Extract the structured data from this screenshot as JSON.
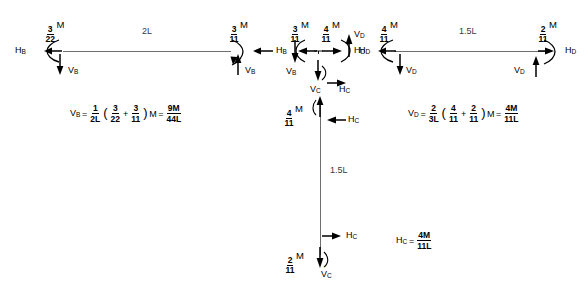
{
  "diagram": {
    "line_color": "#6e6e6e",
    "text_color": "#000000"
  },
  "members": {
    "left_beam": {
      "length_label": "2L"
    },
    "right_beam": {
      "length_label": "1.5L"
    },
    "column": {
      "length_label": "1.5L"
    }
  },
  "moments": {
    "left_end_B": {
      "num": "3",
      "den": "22",
      "unit": "M"
    },
    "left_beam_right_end": {
      "num": "3",
      "den": "11",
      "unit": "M"
    },
    "joint_left": {
      "num": "3",
      "den": "11",
      "unit": "M"
    },
    "joint_right": {
      "num": "4",
      "den": "11",
      "unit": "M"
    },
    "right_beam_left_end": {
      "num": "4",
      "den": "11",
      "unit": "M"
    },
    "right_end_D": {
      "num": "2",
      "den": "11",
      "unit": "M"
    },
    "column_top": {
      "num": "4",
      "den": "11",
      "unit": "M"
    },
    "column_bottom": {
      "num": "2",
      "den": "11",
      "unit": "M"
    }
  },
  "forces": {
    "HB": {
      "base": "H",
      "sub": "B"
    },
    "VB": {
      "base": "V",
      "sub": "B"
    },
    "HC": {
      "base": "H",
      "sub": "C"
    },
    "VC": {
      "base": "V",
      "sub": "C"
    },
    "HD": {
      "base": "H",
      "sub": "D"
    },
    "VD": {
      "base": "V",
      "sub": "D"
    }
  },
  "equations": {
    "VB": {
      "lhs_base": "V",
      "lhs_sub": "B",
      "eq1": "=",
      "coef": {
        "num": "1",
        "den": "2L"
      },
      "open": "(",
      "t1": {
        "num": "3",
        "den": "22"
      },
      "plus": "+",
      "t2": {
        "num": "3",
        "den": "11"
      },
      "close": ")",
      "unit": "M",
      "eq2": "=",
      "result": {
        "num": "9M",
        "den": "44L"
      }
    },
    "VD": {
      "lhs_base": "V",
      "lhs_sub": "D",
      "eq1": "=",
      "coef": {
        "num": "2",
        "den": "3L"
      },
      "open": "(",
      "t1": {
        "num": "4",
        "den": "11"
      },
      "plus": "+",
      "t2": {
        "num": "2",
        "den": "11"
      },
      "close": ")",
      "unit": "M",
      "eq2": "=",
      "result": {
        "num": "4M",
        "den": "11L"
      }
    },
    "HC": {
      "lhs_base": "H",
      "lhs_sub": "C",
      "eq1": "=",
      "result": {
        "num": "4M",
        "den": "11L"
      }
    }
  }
}
